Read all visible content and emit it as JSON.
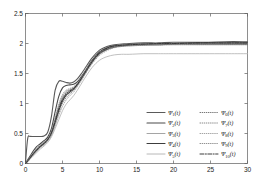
{
  "chart_data": {
    "type": "line",
    "title": "",
    "xlabel": "",
    "ylabel": "",
    "xlim": [
      0,
      30
    ],
    "ylim": [
      0,
      2.5
    ],
    "xticks": [
      "0",
      "5",
      "10",
      "15",
      "20",
      "25",
      "30"
    ],
    "yticks": [
      "0",
      "0.5",
      "1",
      "1.5",
      "2",
      "2.5"
    ],
    "xtick_values": [
      0,
      5,
      10,
      15,
      20,
      25,
      30
    ],
    "ytick_values": [
      0,
      0.5,
      1,
      1.5,
      2,
      2.5
    ],
    "grid": false,
    "legend_position": "lower right",
    "x": [
      0,
      0.3,
      0.6,
      1,
      1.5,
      2,
      2.5,
      3,
      3.5,
      4,
      4.5,
      5,
      5.5,
      6,
      6.5,
      7,
      7.5,
      8,
      9,
      10,
      11,
      12,
      13,
      14,
      16,
      18,
      20,
      24,
      27,
      30
    ],
    "series": [
      {
        "name": "psi_1",
        "label_base": "Ψ",
        "label_sub": "1",
        "label_arg": "(t)",
        "style": "solid",
        "color": "#5a5a5a",
        "width": 1.1,
        "values": [
          0.02,
          0.42,
          0.45,
          0.45,
          0.45,
          0.45,
          0.46,
          0.52,
          0.78,
          1.22,
          1.37,
          1.37,
          1.35,
          1.34,
          1.36,
          1.41,
          1.49,
          1.58,
          1.76,
          1.89,
          1.95,
          1.98,
          1.99,
          2.0,
          2.01,
          2.01,
          2.02,
          2.02,
          2.03,
          2.03
        ]
      },
      {
        "name": "psi_2",
        "label_base": "Ψ",
        "label_sub": "2",
        "label_arg": "(t)",
        "style": "solid",
        "color": "#4a4a4a",
        "width": 1.1,
        "values": [
          0.01,
          0.06,
          0.12,
          0.2,
          0.28,
          0.33,
          0.38,
          0.44,
          0.58,
          0.86,
          1.12,
          1.26,
          1.3,
          1.31,
          1.32,
          1.36,
          1.44,
          1.53,
          1.72,
          1.86,
          1.93,
          1.96,
          1.97,
          1.98,
          1.99,
          2.0,
          2.0,
          2.01,
          2.01,
          2.01
        ]
      },
      {
        "name": "psi_3",
        "label_base": "Ψ",
        "label_sub": "3",
        "label_arg": "(t)",
        "style": "solid",
        "color": "#9b9b9b",
        "width": 0.9,
        "values": [
          0.01,
          0.05,
          0.1,
          0.17,
          0.24,
          0.3,
          0.35,
          0.41,
          0.53,
          0.74,
          0.96,
          1.12,
          1.2,
          1.23,
          1.26,
          1.32,
          1.41,
          1.51,
          1.7,
          1.84,
          1.91,
          1.95,
          1.96,
          1.97,
          1.98,
          1.99,
          1.99,
          2.0,
          2.0,
          2.0
        ]
      },
      {
        "name": "psi_4",
        "label_base": "Ψ",
        "label_sub": "4",
        "label_arg": "(t)",
        "style": "solid",
        "color": "#3c3c3c",
        "width": 1.1,
        "values": [
          0.0,
          0.04,
          0.09,
          0.15,
          0.22,
          0.28,
          0.33,
          0.4,
          0.5,
          0.68,
          0.88,
          1.04,
          1.14,
          1.19,
          1.24,
          1.31,
          1.4,
          1.5,
          1.69,
          1.83,
          1.9,
          1.94,
          1.96,
          1.97,
          1.98,
          1.98,
          1.99,
          1.99,
          1.99,
          1.99
        ]
      },
      {
        "name": "psi_5",
        "label_base": "Ψ",
        "label_sub": "5",
        "label_arg": "(t)",
        "style": "solid",
        "color": "#b0b0b0",
        "width": 0.8,
        "values": [
          0.0,
          0.03,
          0.07,
          0.12,
          0.18,
          0.24,
          0.29,
          0.35,
          0.44,
          0.58,
          0.73,
          0.88,
          0.99,
          1.06,
          1.13,
          1.22,
          1.32,
          1.42,
          1.6,
          1.72,
          1.78,
          1.81,
          1.82,
          1.82,
          1.83,
          1.83,
          1.83,
          1.83,
          1.83,
          1.83
        ]
      },
      {
        "name": "psi_6",
        "label_base": "Ψ",
        "label_sub": "6",
        "label_arg": "(t)",
        "style": "dotted",
        "color": "#6a6a6a",
        "width": 0.9,
        "values": [
          0.0,
          0.04,
          0.09,
          0.16,
          0.23,
          0.29,
          0.34,
          0.4,
          0.52,
          0.72,
          0.93,
          1.09,
          1.18,
          1.22,
          1.26,
          1.33,
          1.42,
          1.52,
          1.71,
          1.85,
          1.92,
          1.95,
          1.97,
          1.97,
          1.98,
          1.99,
          1.99,
          2.0,
          2.0,
          2.0
        ]
      },
      {
        "name": "psi_7",
        "label_base": "Ψ",
        "label_sub": "7",
        "label_arg": "(t)",
        "style": "dotted",
        "color": "#7d7d7d",
        "width": 0.9,
        "values": [
          0.0,
          0.035,
          0.08,
          0.14,
          0.21,
          0.27,
          0.32,
          0.38,
          0.48,
          0.65,
          0.84,
          1.0,
          1.1,
          1.16,
          1.22,
          1.3,
          1.39,
          1.49,
          1.68,
          1.82,
          1.9,
          1.94,
          1.95,
          1.96,
          1.97,
          1.98,
          1.98,
          1.98,
          1.98,
          1.98
        ]
      },
      {
        "name": "psi_8",
        "label_base": "Ψ",
        "label_sub": "8",
        "label_arg": "(t)",
        "style": "dotted",
        "color": "#9a9a9a",
        "width": 0.85,
        "values": [
          0.0,
          0.03,
          0.075,
          0.13,
          0.2,
          0.26,
          0.31,
          0.37,
          0.47,
          0.62,
          0.8,
          0.95,
          1.06,
          1.13,
          1.19,
          1.28,
          1.37,
          1.47,
          1.66,
          1.8,
          1.88,
          1.93,
          1.95,
          1.96,
          1.97,
          1.97,
          1.98,
          1.98,
          1.98,
          1.98
        ]
      },
      {
        "name": "psi_9",
        "label_base": "Ψ",
        "label_sub": "9",
        "label_arg": "(t)",
        "style": "dotted",
        "color": "#868686",
        "width": 0.85,
        "values": [
          0.0,
          0.045,
          0.1,
          0.17,
          0.25,
          0.31,
          0.36,
          0.42,
          0.55,
          0.76,
          0.99,
          1.15,
          1.22,
          1.25,
          1.28,
          1.34,
          1.43,
          1.52,
          1.71,
          1.85,
          1.92,
          1.95,
          1.97,
          1.98,
          1.99,
          1.99,
          2.0,
          2.0,
          2.0,
          2.0
        ]
      },
      {
        "name": "psi_10",
        "label_base": "Ψ",
        "label_sub": "10",
        "label_arg": "(t)",
        "style": "dashdot",
        "color": "#333333",
        "width": 0.95,
        "values": [
          0.0,
          0.04,
          0.09,
          0.155,
          0.225,
          0.285,
          0.335,
          0.395,
          0.51,
          0.7,
          0.91,
          1.07,
          1.16,
          1.21,
          1.25,
          1.32,
          1.41,
          1.51,
          1.7,
          1.85,
          1.92,
          1.96,
          1.97,
          1.98,
          1.99,
          2.0,
          2.0,
          2.01,
          2.01,
          2.01
        ]
      }
    ]
  },
  "legend": {
    "columns": [
      [
        "psi_1",
        "psi_2",
        "psi_3",
        "psi_4",
        "psi_5"
      ],
      [
        "psi_6",
        "psi_7",
        "psi_8",
        "psi_9",
        "psi_10"
      ]
    ]
  }
}
